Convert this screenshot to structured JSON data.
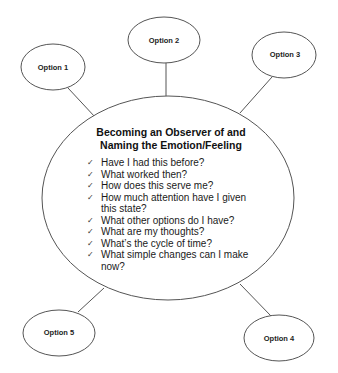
{
  "center": {
    "title_line1": "Becoming an Observer of and",
    "title_line2": "Naming the Emotion/Feeling",
    "check_icon": "✓",
    "items": [
      {
        "line1": "Have I had this before?"
      },
      {
        "line1": "What worked then?"
      },
      {
        "line1": "How does this serve me?"
      },
      {
        "line1": "How much attention have I given",
        "line2": "this state?"
      },
      {
        "line1": "What other options do I have?"
      },
      {
        "line1": "What are my thoughts?"
      },
      {
        "line1": "What’s the cycle of time?"
      },
      {
        "line1": "What simple changes can I make",
        "line2": "now?"
      }
    ]
  },
  "options": [
    {
      "label": "Option 1"
    },
    {
      "label": "Option 2"
    },
    {
      "label": "Option 3"
    },
    {
      "label": "Option 4"
    },
    {
      "label": "Option 5"
    }
  ],
  "colors": {
    "stroke": "#555555",
    "text": "#111111",
    "background": "#ffffff"
  }
}
